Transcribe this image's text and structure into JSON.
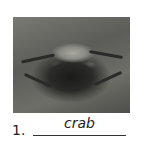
{
  "item": {
    "number": "1.",
    "answer": "crab",
    "image_subject": "crab photo (grayscale)"
  }
}
